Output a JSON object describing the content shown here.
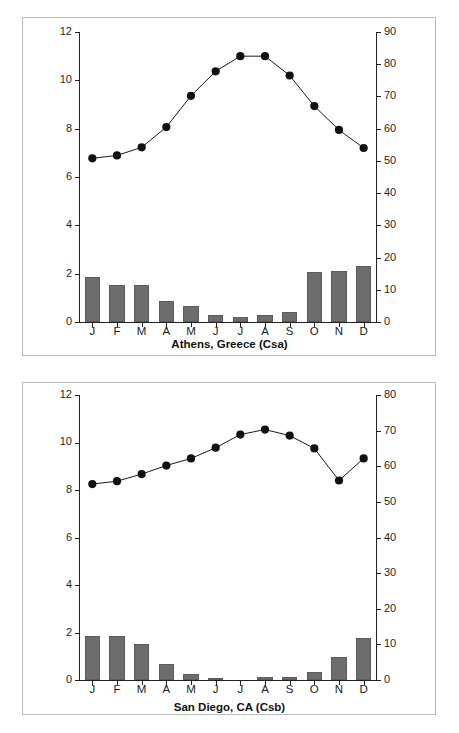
{
  "figure": {
    "background_color": "#ffffff",
    "bar_color": "#6d6d6d",
    "line_color": "#1a1a1a",
    "marker_color": "#111111",
    "axis_color": "#222222",
    "panel_border_color": "#b9bdb9"
  },
  "charts": [
    {
      "id": "athens",
      "caption": "Athens, Greece (Csa)",
      "y_left_title": "Precipitation (in)",
      "y_right_title": "Temperature °F",
      "categories": [
        "J",
        "F",
        "M",
        "A",
        "M",
        "J",
        "J",
        "A",
        "S",
        "O",
        "N",
        "D"
      ],
      "precip_ticks": [
        "0",
        "2",
        "4",
        "6",
        "8",
        "10",
        "12"
      ],
      "temp_ticks": [
        "0",
        "10",
        "20",
        "30",
        "40",
        "50",
        "60",
        "70",
        "80",
        "90"
      ],
      "precip_range": [
        0,
        12
      ],
      "temp_range": [
        0,
        90
      ],
      "precipitation": [
        1.85,
        1.55,
        1.55,
        0.85,
        0.65,
        0.3,
        0.2,
        0.28,
        0.42,
        2.08,
        2.12,
        2.33
      ],
      "temperature": [
        50.8,
        51.7,
        54.2,
        60.5,
        70.2,
        77.8,
        82.5,
        82.5,
        76.5,
        67.0,
        59.6,
        54.0
      ]
    },
    {
      "id": "sandiego",
      "caption": "San Diego, CA (Csb)",
      "y_left_title": "Precipitation (in)",
      "y_right_title": "Temperature °F",
      "categories": [
        "J",
        "F",
        "M",
        "A",
        "M",
        "J",
        "J",
        "A",
        "S",
        "O",
        "N",
        "D"
      ],
      "precip_ticks": [
        "0",
        "2",
        "4",
        "6",
        "8",
        "10",
        "12"
      ],
      "temp_ticks": [
        "0",
        "10",
        "20",
        "30",
        "40",
        "50",
        "60",
        "70",
        "80"
      ],
      "precip_range": [
        0,
        12
      ],
      "temp_range": [
        0,
        80
      ],
      "precipitation": [
        1.86,
        1.87,
        1.52,
        0.68,
        0.26,
        0.08,
        0.0,
        0.11,
        0.12,
        0.35,
        0.98,
        1.76
      ],
      "temperature": [
        55.0,
        55.8,
        57.8,
        60.2,
        62.2,
        65.2,
        68.9,
        70.3,
        68.6,
        65.0,
        56.0,
        62.2
      ]
    }
  ],
  "chart_data": {
    "type": "bar",
    "subcharts": [
      {
        "type": "bar",
        "title": "Athens, Greece (Csa)",
        "xlabel": "",
        "ylabel": "Precipitation (in)",
        "y2label": "Temperature °F",
        "categories": [
          "J",
          "F",
          "M",
          "A",
          "M",
          "J",
          "J",
          "A",
          "S",
          "O",
          "N",
          "D"
        ],
        "ylim": [
          0,
          12
        ],
        "y2lim": [
          0,
          90
        ],
        "yticks": [
          0,
          2,
          4,
          6,
          8,
          10,
          12
        ],
        "y2ticks": [
          0,
          10,
          20,
          30,
          40,
          50,
          60,
          70,
          80,
          90
        ],
        "grid": false,
        "legend": "none",
        "series": [
          {
            "name": "Precipitation (in)",
            "type": "bar",
            "axis": "left",
            "values": [
              1.85,
              1.55,
              1.55,
              0.85,
              0.65,
              0.3,
              0.2,
              0.28,
              0.42,
              2.08,
              2.12,
              2.33
            ]
          },
          {
            "name": "Temperature °F",
            "type": "line",
            "axis": "right",
            "values": [
              50.8,
              51.7,
              54.2,
              60.5,
              70.2,
              77.8,
              82.5,
              82.5,
              76.5,
              67.0,
              59.6,
              54.0
            ]
          }
        ]
      },
      {
        "type": "bar",
        "title": "San Diego, CA (Csb)",
        "xlabel": "",
        "ylabel": "Precipitation (in)",
        "y2label": "Temperature °F",
        "categories": [
          "J",
          "F",
          "M",
          "A",
          "M",
          "J",
          "J",
          "A",
          "S",
          "O",
          "N",
          "D"
        ],
        "ylim": [
          0,
          12
        ],
        "y2lim": [
          0,
          80
        ],
        "yticks": [
          0,
          2,
          4,
          6,
          8,
          10,
          12
        ],
        "y2ticks": [
          0,
          10,
          20,
          30,
          40,
          50,
          60,
          70,
          80
        ],
        "grid": false,
        "legend": "none",
        "series": [
          {
            "name": "Precipitation (in)",
            "type": "bar",
            "axis": "left",
            "values": [
              1.86,
              1.87,
              1.52,
              0.68,
              0.26,
              0.08,
              0.0,
              0.11,
              0.12,
              0.35,
              0.98,
              1.76
            ]
          },
          {
            "name": "Temperature °F",
            "type": "line",
            "axis": "right",
            "values": [
              55.0,
              55.8,
              57.8,
              60.2,
              62.2,
              65.2,
              68.9,
              70.3,
              68.6,
              65.0,
              56.0,
              62.2
            ]
          }
        ]
      }
    ]
  }
}
